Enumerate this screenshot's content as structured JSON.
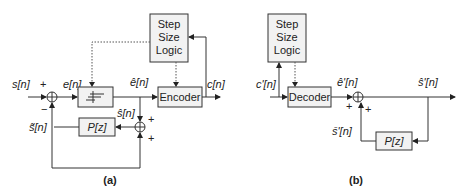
{
  "diagram_a": {
    "caption": "(a)",
    "step_size_logic": [
      "Step",
      "Size",
      "Logic"
    ],
    "encoder_label": "Encoder",
    "predictor_label": "P[z]",
    "signals": {
      "input": "s[n]",
      "error": "e[n]",
      "quantized_error": "ê[n]",
      "code": "c[n]",
      "reconstructed": "ŝ[n]",
      "predicted": "s̃[n]"
    },
    "signs": {
      "input_plus": "+",
      "feedback_minus": "−",
      "recon_plus_top": "+",
      "recon_plus_bottom": "+"
    },
    "quantizer_symbol": "quantizer-staircase"
  },
  "diagram_b": {
    "caption": "(b)",
    "step_size_logic": [
      "Step",
      "Size",
      "Logic"
    ],
    "decoder_label": "Decoder",
    "predictor_label": "P[z]",
    "signals": {
      "code_in": "c'[n]",
      "decoded_error": "ê'[n]",
      "output": "ŝ'[n]",
      "predicted": "s̄'[n]"
    },
    "signs": {
      "plus_left": "+",
      "plus_right": "+"
    }
  }
}
